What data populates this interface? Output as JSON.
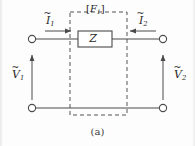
{
  "figure": {
    "caption": "(a)",
    "network_block_label_bracket_open": "[",
    "network_block_label_symbol": "F",
    "network_block_label_subscript": "1",
    "network_block_label_bracket_close": "]",
    "impedance_label": "Z",
    "colors": {
      "line": "#4a4a4a",
      "dashed": "#555555",
      "text": "#2b2b2b",
      "background": "#fdfdfd"
    }
  },
  "labels": {
    "current_left": {
      "symbol": "I",
      "accent": "~",
      "subscript": "1",
      "direction": "right"
    },
    "current_right": {
      "symbol": "I",
      "accent": "~",
      "subscript": "2",
      "direction": "left"
    },
    "voltage_left": {
      "symbol": "V",
      "accent": "~",
      "subscript": "1",
      "direction": "up"
    },
    "voltage_right": {
      "symbol": "V",
      "accent": "~",
      "subscript": "2",
      "direction": "up"
    }
  },
  "terminals": {
    "top_left": "open-terminal",
    "bottom_left": "open-terminal",
    "top_right": "open-terminal",
    "bottom_right": "open-terminal"
  }
}
